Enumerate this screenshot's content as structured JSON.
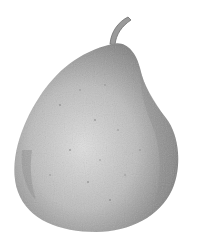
{
  "image": {
    "subject": "pear",
    "style": "grayscale botanical illustration",
    "background": "#ffffff",
    "colors": {
      "highlight": "#dcdcdc",
      "midtone": "#b4b4b4",
      "shadow": "#7a7a7a",
      "stem": "#9a9a9a"
    }
  }
}
